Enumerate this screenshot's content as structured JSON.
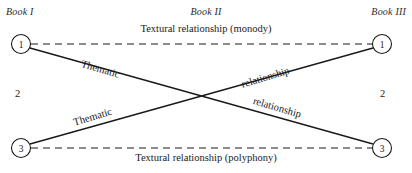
{
  "diagram": {
    "background_color": "#ffffff",
    "line_color": "#1a1a1a",
    "headers": {
      "book_1": "Book I",
      "book_2": "Book II",
      "book_3": "Book III"
    },
    "nodes": {
      "top_left": "1",
      "top_right": "1",
      "bottom_left": "3",
      "bottom_right": "3",
      "middle_left": "2",
      "middle_right": "2"
    },
    "edges": {
      "top_dashed": "Textural relationship (monody)",
      "bottom_dashed": "Textural relationship (polyphony)",
      "diagonal_down_start": "Thematic",
      "diagonal_down_end": "relationship",
      "diagonal_up_start": "Thematic",
      "diagonal_up_end": "relationship"
    }
  }
}
